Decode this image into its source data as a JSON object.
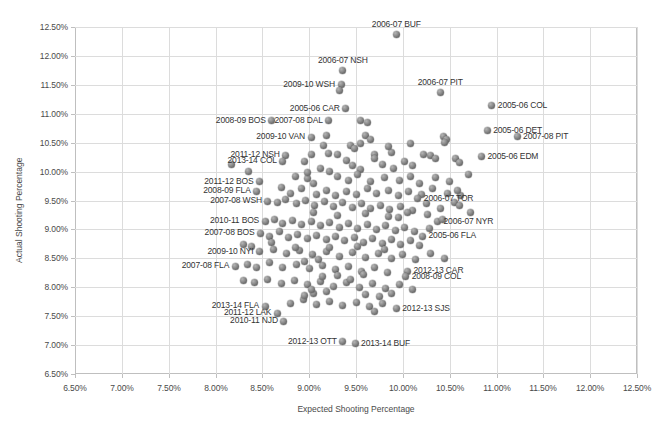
{
  "chart_data": {
    "type": "scatter",
    "title": "",
    "xlabel": "Expected Shooting Percentage",
    "ylabel": "Actual Shooting Percentage",
    "xlim": [
      6.5,
      12.5
    ],
    "ylim": [
      6.5,
      12.5
    ],
    "xticks": [
      "6.50%",
      "7.00%",
      "7.50%",
      "8.00%",
      "8.50%",
      "9.00%",
      "9.50%",
      "10.00%",
      "10.50%",
      "11.00%",
      "11.50%",
      "12.00%",
      "12.50%"
    ],
    "yticks": [
      "6.50%",
      "7.00%",
      "7.50%",
      "8.00%",
      "8.50%",
      "9.00%",
      "9.50%",
      "10.00%",
      "10.50%",
      "11.00%",
      "11.50%",
      "12.00%",
      "12.50%"
    ],
    "xtick_values": [
      6.5,
      7.0,
      7.5,
      8.0,
      8.5,
      9.0,
      9.5,
      10.0,
      10.5,
      11.0,
      11.5,
      12.0,
      12.5
    ],
    "ytick_values": [
      6.5,
      7.0,
      7.5,
      8.0,
      8.5,
      9.0,
      9.5,
      10.0,
      10.5,
      11.0,
      11.5,
      12.0,
      12.5
    ],
    "grid": true,
    "legend": "none",
    "marker_color": "#7a7a7a",
    "series_name": "NHL team seasons",
    "annotated_points": [
      {
        "label": "2006-07 BUF",
        "x": 9.93,
        "y": 12.37,
        "anchor": "above"
      },
      {
        "label": "2006-07 NSH",
        "x": 9.36,
        "y": 11.74,
        "anchor": "above"
      },
      {
        "label": "2009-10 WSH",
        "x": 9.34,
        "y": 11.5,
        "anchor": "left"
      },
      {
        "label": "2006-07 PIT",
        "x": 10.4,
        "y": 11.36,
        "anchor": "above"
      },
      {
        "label": "2005-06 COL",
        "x": 10.95,
        "y": 11.14,
        "anchor": "right"
      },
      {
        "label": "2005-06 CAR",
        "x": 9.39,
        "y": 11.09,
        "anchor": "left"
      },
      {
        "label": "2008-09 BOS",
        "x": 8.6,
        "y": 10.88,
        "anchor": "left"
      },
      {
        "label": "2007-08 DAL",
        "x": 9.21,
        "y": 10.88,
        "anchor": "left"
      },
      {
        "label": "2005-06 DET",
        "x": 10.9,
        "y": 10.71,
        "anchor": "right"
      },
      {
        "label": "2007-08 PIT",
        "x": 11.22,
        "y": 10.6,
        "anchor": "right"
      },
      {
        "label": "2009-10 VAN",
        "x": 9.02,
        "y": 10.59,
        "anchor": "left"
      },
      {
        "label": "2011-12 NSH",
        "x": 8.75,
        "y": 10.28,
        "anchor": "left"
      },
      {
        "label": "2013-14 COL",
        "x": 8.72,
        "y": 10.18,
        "anchor": "left"
      },
      {
        "label": "2005-06 EDM",
        "x": 10.84,
        "y": 10.26,
        "anchor": "right"
      },
      {
        "label": "2011-12 BOS",
        "x": 8.47,
        "y": 9.82,
        "anchor": "left"
      },
      {
        "label": "2008-09 FLA",
        "x": 8.44,
        "y": 9.66,
        "anchor": "left"
      },
      {
        "label": "2007-08 WSH",
        "x": 8.56,
        "y": 9.49,
        "anchor": "left"
      },
      {
        "label": "2010-11 BOS",
        "x": 8.53,
        "y": 9.14,
        "anchor": "left"
      },
      {
        "label": "2006-07 TOR",
        "x": 10.16,
        "y": 9.53,
        "anchor": "right"
      },
      {
        "label": "2006-07 NYR",
        "x": 10.37,
        "y": 9.13,
        "anchor": "right"
      },
      {
        "label": "2007-08 BOS",
        "x": 8.48,
        "y": 8.93,
        "anchor": "left"
      },
      {
        "label": "2009-10 NYI",
        "x": 8.47,
        "y": 8.61,
        "anchor": "left"
      },
      {
        "label": "2005-06 FLA",
        "x": 10.21,
        "y": 8.88,
        "anchor": "right"
      },
      {
        "label": "2007-08 FLA",
        "x": 8.21,
        "y": 8.36,
        "anchor": "left"
      },
      {
        "label": "2012-13 CAR",
        "x": 10.05,
        "y": 8.28,
        "anchor": "right"
      },
      {
        "label": "2008-09 COL",
        "x": 10.03,
        "y": 8.18,
        "anchor": "right"
      },
      {
        "label": "2013-14 FLA",
        "x": 8.53,
        "y": 7.67,
        "anchor": "left"
      },
      {
        "label": "2011-12 LAK",
        "x": 8.66,
        "y": 7.55,
        "anchor": "left"
      },
      {
        "label": "2012-13 SJS",
        "x": 9.93,
        "y": 7.63,
        "anchor": "right"
      },
      {
        "label": "2010-11 NJD",
        "x": 8.73,
        "y": 7.41,
        "anchor": "left"
      },
      {
        "label": "2012-13 OTT",
        "x": 9.36,
        "y": 7.06,
        "anchor": "left"
      },
      {
        "label": "2013-14 BUF",
        "x": 9.49,
        "y": 7.02,
        "anchor": "right"
      }
    ],
    "points": [
      [
        9.93,
        12.37
      ],
      [
        9.36,
        11.74
      ],
      [
        9.34,
        11.5
      ],
      [
        9.32,
        11.4
      ],
      [
        10.4,
        11.36
      ],
      [
        10.95,
        11.14
      ],
      [
        9.39,
        11.09
      ],
      [
        8.6,
        10.88
      ],
      [
        9.21,
        10.88
      ],
      [
        9.55,
        10.88
      ],
      [
        9.62,
        10.85
      ],
      [
        10.9,
        10.71
      ],
      [
        11.22,
        10.6
      ],
      [
        9.02,
        10.59
      ],
      [
        9.18,
        10.62
      ],
      [
        9.6,
        10.62
      ],
      [
        9.66,
        10.55
      ],
      [
        9.44,
        10.45
      ],
      [
        9.48,
        10.4
      ],
      [
        10.43,
        10.6
      ],
      [
        10.47,
        10.56
      ],
      [
        10.44,
        10.5
      ],
      [
        8.75,
        10.28
      ],
      [
        8.72,
        10.18
      ],
      [
        9.02,
        10.3
      ],
      [
        9.21,
        10.32
      ],
      [
        9.3,
        10.3
      ],
      [
        9.7,
        10.3
      ],
      [
        9.88,
        10.33
      ],
      [
        10.84,
        10.26
      ],
      [
        10.3,
        10.27
      ],
      [
        10.35,
        10.22
      ],
      [
        8.17,
        10.12
      ],
      [
        8.35,
        10.0
      ],
      [
        8.95,
        10.18
      ],
      [
        9.12,
        10.05
      ],
      [
        9.22,
        10.0
      ],
      [
        9.46,
        10.1
      ],
      [
        9.55,
        10.03
      ],
      [
        9.78,
        10.12
      ],
      [
        9.9,
        10.06
      ],
      [
        10.02,
        10.18
      ],
      [
        10.1,
        10.1
      ],
      [
        10.22,
        10.3
      ],
      [
        10.56,
        10.22
      ],
      [
        10.6,
        10.15
      ],
      [
        8.47,
        9.82
      ],
      [
        8.85,
        9.92
      ],
      [
        8.98,
        9.88
      ],
      [
        9.05,
        9.8
      ],
      [
        9.3,
        9.92
      ],
      [
        9.42,
        9.84
      ],
      [
        9.52,
        9.95
      ],
      [
        9.65,
        9.82
      ],
      [
        9.8,
        9.9
      ],
      [
        9.96,
        9.85
      ],
      [
        10.08,
        9.92
      ],
      [
        10.18,
        9.8
      ],
      [
        10.35,
        9.9
      ],
      [
        10.5,
        9.82
      ],
      [
        10.7,
        9.95
      ],
      [
        8.44,
        9.66
      ],
      [
        8.7,
        9.72
      ],
      [
        8.8,
        9.62
      ],
      [
        8.92,
        9.7
      ],
      [
        9.08,
        9.6
      ],
      [
        9.18,
        9.68
      ],
      [
        9.28,
        9.58
      ],
      [
        9.4,
        9.66
      ],
      [
        9.5,
        9.6
      ],
      [
        9.62,
        9.7
      ],
      [
        9.72,
        9.62
      ],
      [
        9.85,
        9.68
      ],
      [
        9.95,
        9.58
      ],
      [
        10.06,
        9.66
      ],
      [
        10.2,
        9.6
      ],
      [
        10.32,
        9.7
      ],
      [
        10.48,
        9.62
      ],
      [
        10.62,
        9.58
      ],
      [
        8.56,
        9.49
      ],
      [
        8.66,
        9.46
      ],
      [
        8.75,
        9.52
      ],
      [
        8.86,
        9.44
      ],
      [
        8.96,
        9.5
      ],
      [
        9.06,
        9.42
      ],
      [
        9.16,
        9.48
      ],
      [
        9.26,
        9.4
      ],
      [
        9.36,
        9.46
      ],
      [
        9.46,
        9.38
      ],
      [
        9.56,
        9.44
      ],
      [
        9.66,
        9.36
      ],
      [
        9.76,
        9.42
      ],
      [
        9.86,
        9.34
      ],
      [
        9.98,
        9.4
      ],
      [
        10.1,
        9.32
      ],
      [
        10.16,
        9.53
      ],
      [
        10.25,
        9.44
      ],
      [
        10.4,
        9.36
      ],
      [
        10.55,
        9.46
      ],
      [
        8.53,
        9.14
      ],
      [
        8.63,
        9.18
      ],
      [
        8.72,
        9.1
      ],
      [
        8.82,
        9.16
      ],
      [
        8.92,
        9.08
      ],
      [
        9.02,
        9.14
      ],
      [
        9.12,
        9.06
      ],
      [
        9.22,
        9.12
      ],
      [
        9.32,
        9.04
      ],
      [
        9.42,
        9.1
      ],
      [
        9.52,
        9.02
      ],
      [
        9.62,
        9.08
      ],
      [
        9.72,
        9.0
      ],
      [
        9.82,
        9.06
      ],
      [
        9.92,
        8.98
      ],
      [
        10.02,
        9.04
      ],
      [
        10.12,
        8.96
      ],
      [
        10.37,
        9.13
      ],
      [
        10.28,
        9.02
      ],
      [
        8.48,
        8.93
      ],
      [
        8.58,
        8.88
      ],
      [
        8.68,
        8.96
      ],
      [
        8.78,
        8.86
      ],
      [
        8.88,
        8.92
      ],
      [
        8.98,
        8.84
      ],
      [
        9.08,
        8.9
      ],
      [
        9.18,
        8.82
      ],
      [
        9.28,
        8.88
      ],
      [
        9.38,
        8.8
      ],
      [
        9.48,
        8.86
      ],
      [
        9.58,
        8.78
      ],
      [
        9.68,
        8.84
      ],
      [
        9.78,
        8.76
      ],
      [
        9.88,
        8.82
      ],
      [
        9.98,
        8.74
      ],
      [
        10.08,
        8.8
      ],
      [
        10.21,
        8.88
      ],
      [
        10.18,
        8.72
      ],
      [
        8.47,
        8.61
      ],
      [
        8.62,
        8.66
      ],
      [
        8.76,
        8.58
      ],
      [
        8.9,
        8.64
      ],
      [
        9.04,
        8.56
      ],
      [
        9.18,
        8.62
      ],
      [
        9.32,
        8.54
      ],
      [
        9.46,
        8.6
      ],
      [
        9.6,
        8.52
      ],
      [
        9.74,
        8.58
      ],
      [
        9.88,
        8.5
      ],
      [
        10.0,
        8.56
      ],
      [
        10.14,
        8.48
      ],
      [
        10.3,
        8.58
      ],
      [
        10.44,
        8.5
      ],
      [
        8.21,
        8.36
      ],
      [
        8.34,
        8.4
      ],
      [
        8.44,
        8.35
      ],
      [
        8.58,
        8.42
      ],
      [
        8.72,
        8.34
      ],
      [
        8.86,
        8.4
      ],
      [
        9.0,
        8.32
      ],
      [
        9.14,
        8.38
      ],
      [
        9.28,
        8.3
      ],
      [
        9.42,
        8.36
      ],
      [
        9.56,
        8.28
      ],
      [
        9.7,
        8.34
      ],
      [
        9.84,
        8.26
      ],
      [
        10.05,
        8.28
      ],
      [
        10.03,
        8.18
      ],
      [
        8.3,
        8.12
      ],
      [
        8.42,
        8.08
      ],
      [
        8.56,
        8.14
      ],
      [
        8.7,
        8.06
      ],
      [
        8.84,
        8.12
      ],
      [
        8.98,
        8.04
      ],
      [
        9.12,
        8.1
      ],
      [
        9.26,
        8.02
      ],
      [
        9.4,
        8.08
      ],
      [
        9.54,
        8.0
      ],
      [
        9.68,
        8.06
      ],
      [
        9.82,
        7.98
      ],
      [
        9.96,
        8.04
      ],
      [
        10.1,
        7.96
      ],
      [
        8.53,
        7.67
      ],
      [
        8.66,
        7.55
      ],
      [
        8.73,
        7.41
      ],
      [
        8.8,
        7.72
      ],
      [
        8.94,
        7.78
      ],
      [
        9.08,
        7.7
      ],
      [
        9.22,
        7.76
      ],
      [
        9.36,
        7.68
      ],
      [
        9.5,
        7.74
      ],
      [
        9.64,
        7.66
      ],
      [
        9.78,
        7.72
      ],
      [
        9.93,
        7.63
      ],
      [
        9.7,
        7.58
      ],
      [
        9.36,
        7.06
      ],
      [
        9.49,
        7.02
      ],
      [
        8.95,
        7.86
      ],
      [
        9.05,
        7.9
      ],
      [
        9.6,
        7.88
      ],
      [
        9.75,
        7.84
      ],
      [
        9.88,
        7.9
      ],
      [
        8.95,
        8.44
      ],
      [
        9.1,
        8.48
      ],
      [
        8.3,
        8.74
      ],
      [
        8.38,
        8.7
      ],
      [
        8.6,
        8.78
      ],
      [
        9.95,
        9.2
      ],
      [
        10.26,
        9.26
      ],
      [
        10.42,
        9.18
      ],
      [
        9.15,
        10.45
      ],
      [
        9.55,
        10.48
      ],
      [
        9.85,
        10.44
      ],
      [
        10.08,
        10.48
      ],
      [
        9.05,
        9.3
      ],
      [
        9.3,
        9.24
      ],
      [
        9.6,
        9.28
      ],
      [
        9.85,
        9.22
      ],
      [
        10.05,
        9.3
      ],
      [
        8.98,
        9.98
      ],
      [
        9.4,
        10.2
      ],
      [
        9.7,
        10.22
      ],
      [
        10.6,
        9.42
      ],
      [
        10.58,
        9.68
      ],
      [
        10.72,
        9.3
      ],
      [
        8.85,
        8.68
      ],
      [
        9.22,
        8.68
      ],
      [
        9.52,
        8.7
      ],
      [
        9.8,
        8.66
      ],
      [
        9.14,
        8.18
      ],
      [
        9.3,
        8.2
      ],
      [
        9.44,
        8.14
      ],
      [
        9.58,
        8.22
      ],
      [
        9.02,
        7.96
      ],
      [
        9.18,
        7.92
      ]
    ]
  }
}
